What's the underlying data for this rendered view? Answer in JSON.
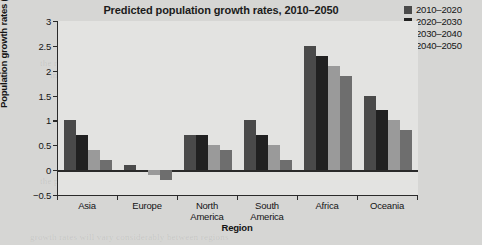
{
  "chart_data": {
    "type": "bar",
    "title": "Predicted population growth rates, 2010–2050",
    "xlabel": "Region",
    "ylabel": "Population growth rates (%)",
    "categories": [
      "Asia",
      "Europe",
      "North America",
      "South America",
      "Africa",
      "Oceania"
    ],
    "category_lines": [
      [
        "Asia"
      ],
      [
        "Europe"
      ],
      [
        "North",
        "America"
      ],
      [
        "South",
        "America"
      ],
      [
        "Africa"
      ],
      [
        "Oceania"
      ]
    ],
    "series": [
      {
        "name": "2010–2020",
        "color": "#4a4a4a",
        "values": [
          1.0,
          0.1,
          0.7,
          1.0,
          2.5,
          1.5
        ]
      },
      {
        "name": "2020–2030",
        "color": "#212121",
        "values": [
          0.7,
          0.0,
          0.7,
          0.7,
          2.3,
          1.2
        ]
      },
      {
        "name": "2030–2040",
        "color": "#9a9a9a",
        "values": [
          0.4,
          -0.1,
          0.5,
          0.5,
          2.1,
          1.0
        ]
      },
      {
        "name": "2040–2050",
        "color": "#6e6e6e",
        "values": [
          0.2,
          -0.2,
          0.4,
          0.2,
          1.9,
          0.8
        ]
      }
    ],
    "ylim": [
      -0.5,
      3
    ],
    "yticks": [
      -0.5,
      0,
      0.5,
      1,
      1.5,
      2,
      2.5,
      3
    ],
    "ytick_labels": [
      "−0.5",
      "0",
      "0.5",
      "1",
      "1.5",
      "2",
      "2.5",
      "3"
    ],
    "grid": false,
    "legend_position": "top-right",
    "bar_width_px": 12,
    "plot_background": "#e3e3e1",
    "figure_background": "#d6d6d4"
  },
  "bleed_text": [
    {
      "x": 60,
      "y": 32,
      "text": "most of the population across the developing world"
    },
    {
      "x": 150,
      "y": 44,
      "text": "sustainable growth of the region"
    },
    {
      "x": 40,
      "y": 58,
      "text": "the rapid rate of population growth in much of the"
    },
    {
      "x": 50,
      "y": 70,
      "text": "increase in the world population that will be seen"
    },
    {
      "x": 80,
      "y": 84,
      "text": "the rate of change in the global population"
    },
    {
      "x": 60,
      "y": 98,
      "text": "demographic transition and its effect on society"
    },
    {
      "x": 70,
      "y": 150,
      "text": "considered alongside economic development trends"
    },
    {
      "x": 40,
      "y": 176,
      "text": "the projected figures shown above indicate that"
    },
    {
      "x": 30,
      "y": 232,
      "text": "growth rates will vary considerably between regions"
    }
  ]
}
